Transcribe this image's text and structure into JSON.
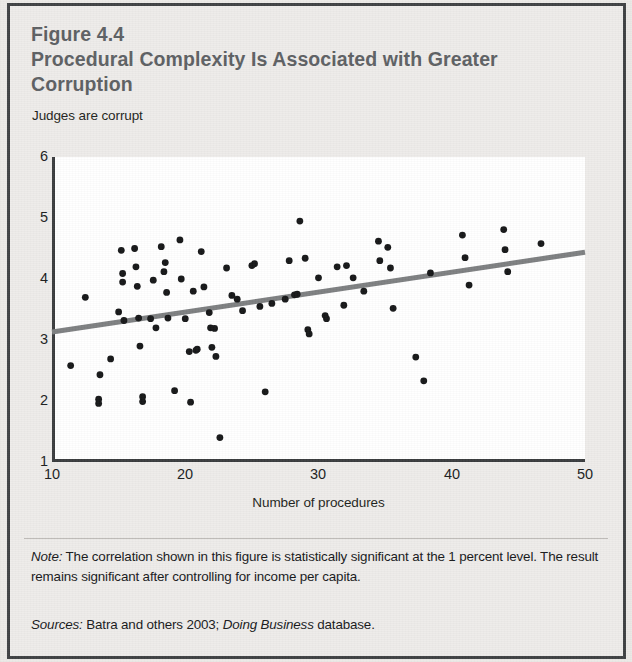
{
  "figure": {
    "number_label": "Figure 4.4",
    "title": "Procedural Complexity Is Associated with Greater Corruption",
    "note_prefix": "Note:",
    "note_text": " The correlation shown in this figure is statistically significant at the 1 percent level. The result remains significant after controlling for income per capita.",
    "sources_prefix": "Sources:",
    "sources_text_part1": " Batra and others 2003; ",
    "sources_italic": "Doing Business",
    "sources_text_part2": " database."
  },
  "colors": {
    "page_background": "#eceae7",
    "border": "#3f4143",
    "title_text": "#5d6063",
    "body_text": "#17181a",
    "plot_background": "#ffffff",
    "axis": "#3a3c3e",
    "point": "#151617",
    "trendline": "#7d7f81"
  },
  "chart_data": {
    "type": "scatter",
    "title": "Procedural Complexity Is Associated with Greater Corruption",
    "xlabel": "Number of procedures",
    "ylabel": "Judges are corrupt",
    "xlim": [
      10,
      50
    ],
    "ylim": [
      1,
      6
    ],
    "xticks": [
      10,
      20,
      30,
      40,
      50
    ],
    "yticks": [
      1,
      2,
      3,
      4,
      5,
      6
    ],
    "grid": false,
    "legend": null,
    "trendline": {
      "type": "linear-fit",
      "x_start": 10,
      "y_start": 3.13,
      "x_end": 50,
      "y_end": 4.44,
      "color": "#7d7f81",
      "width": 5
    },
    "points": [
      [
        11.4,
        2.58
      ],
      [
        12.5,
        3.7
      ],
      [
        13.5,
        2.03
      ],
      [
        13.5,
        1.96
      ],
      [
        13.6,
        2.43
      ],
      [
        14.4,
        2.69
      ],
      [
        15.0,
        3.46
      ],
      [
        15.2,
        4.47
      ],
      [
        15.3,
        3.95
      ],
      [
        15.3,
        4.09
      ],
      [
        15.4,
        3.32
      ],
      [
        16.2,
        4.5
      ],
      [
        16.3,
        4.2
      ],
      [
        16.4,
        3.88
      ],
      [
        16.5,
        3.36
      ],
      [
        16.6,
        2.9
      ],
      [
        16.8,
        1.99
      ],
      [
        16.8,
        2.07
      ],
      [
        17.4,
        3.35
      ],
      [
        17.6,
        3.98
      ],
      [
        17.8,
        3.2
      ],
      [
        18.2,
        4.53
      ],
      [
        18.4,
        4.12
      ],
      [
        18.5,
        4.27
      ],
      [
        18.6,
        3.78
      ],
      [
        18.7,
        3.36
      ],
      [
        19.2,
        2.17
      ],
      [
        19.6,
        4.64
      ],
      [
        19.7,
        4.0
      ],
      [
        20.0,
        3.35
      ],
      [
        20.3,
        2.81
      ],
      [
        20.4,
        1.98
      ],
      [
        20.6,
        3.8
      ],
      [
        20.8,
        2.83
      ],
      [
        20.9,
        2.85
      ],
      [
        21.2,
        4.45
      ],
      [
        21.4,
        3.87
      ],
      [
        21.8,
        3.45
      ],
      [
        21.9,
        3.2
      ],
      [
        22.0,
        2.88
      ],
      [
        22.2,
        3.19
      ],
      [
        22.3,
        2.73
      ],
      [
        22.6,
        1.4
      ],
      [
        23.1,
        4.18
      ],
      [
        23.5,
        3.73
      ],
      [
        23.9,
        3.67
      ],
      [
        24.3,
        3.48
      ],
      [
        25.0,
        4.22
      ],
      [
        25.2,
        4.25
      ],
      [
        25.6,
        3.55
      ],
      [
        26.0,
        2.15
      ],
      [
        26.5,
        3.6
      ],
      [
        27.5,
        3.67
      ],
      [
        27.8,
        4.3
      ],
      [
        28.2,
        3.74
      ],
      [
        28.4,
        3.75
      ],
      [
        28.6,
        4.95
      ],
      [
        29.0,
        4.34
      ],
      [
        29.2,
        3.17
      ],
      [
        29.3,
        3.1
      ],
      [
        30.0,
        4.02
      ],
      [
        30.5,
        3.4
      ],
      [
        30.6,
        3.35
      ],
      [
        31.4,
        4.2
      ],
      [
        31.9,
        3.57
      ],
      [
        32.1,
        4.22
      ],
      [
        32.6,
        4.02
      ],
      [
        33.4,
        3.8
      ],
      [
        34.5,
        4.62
      ],
      [
        34.6,
        4.3
      ],
      [
        35.2,
        4.52
      ],
      [
        35.4,
        4.18
      ],
      [
        35.6,
        3.52
      ],
      [
        37.3,
        2.72
      ],
      [
        37.9,
        2.33
      ],
      [
        38.4,
        4.1
      ],
      [
        40.8,
        4.72
      ],
      [
        41.0,
        4.35
      ],
      [
        41.3,
        3.9
      ],
      [
        43.9,
        4.81
      ],
      [
        44.0,
        4.48
      ],
      [
        44.2,
        4.12
      ],
      [
        46.7,
        4.58
      ]
    ]
  }
}
